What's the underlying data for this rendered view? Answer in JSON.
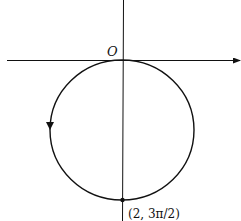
{
  "diagram": {
    "type": "polar-curve",
    "origin_label": "O",
    "point_label": "(2, 3π/2)",
    "curve": "circle tangent to horizontal axis at origin, below axis",
    "direction": "counterclockwise (arrow pointing down on left side)",
    "colors": {
      "stroke": "#111111",
      "background": "#ffffff"
    }
  }
}
